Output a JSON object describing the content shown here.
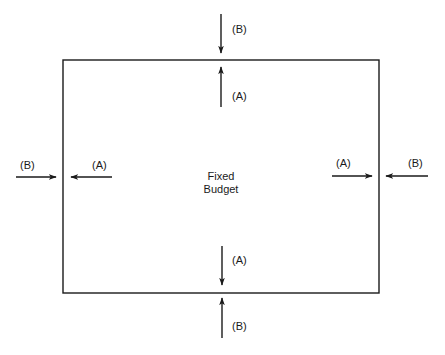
{
  "diagram": {
    "center_label": [
      "Fixed",
      "Budget"
    ],
    "box": {
      "x": 63,
      "y": 60,
      "width": 316,
      "height": 233
    },
    "arrows": [
      {
        "id": "top-outer",
        "label": "(B)",
        "direction": "down",
        "x1": 221,
        "y1": 14,
        "x2": 221,
        "y2": 53,
        "lx": 232,
        "ly": 33
      },
      {
        "id": "top-inner",
        "label": "(A)",
        "direction": "up",
        "x1": 221,
        "y1": 107,
        "x2": 221,
        "y2": 67,
        "lx": 232,
        "ly": 100
      },
      {
        "id": "left-outer",
        "label": "(B)",
        "direction": "right",
        "x1": 16,
        "y1": 177,
        "x2": 56,
        "y2": 177,
        "lx": 20,
        "ly": 169
      },
      {
        "id": "left-inner",
        "label": "(A)",
        "direction": "left",
        "x1": 112,
        "y1": 177,
        "x2": 71,
        "y2": 177,
        "lx": 92,
        "ly": 169
      },
      {
        "id": "right-inner",
        "label": "(A)",
        "direction": "right",
        "x1": 332,
        "y1": 176,
        "x2": 372,
        "y2": 176,
        "lx": 336,
        "ly": 167
      },
      {
        "id": "right-outer",
        "label": "(B)",
        "direction": "left",
        "x1": 428,
        "y1": 176,
        "x2": 386,
        "y2": 176,
        "lx": 408,
        "ly": 167
      },
      {
        "id": "bottom-inner",
        "label": "(A)",
        "direction": "down",
        "x1": 222,
        "y1": 246,
        "x2": 222,
        "y2": 285,
        "lx": 232,
        "ly": 264
      },
      {
        "id": "bottom-outer",
        "label": "(B)",
        "direction": "up",
        "x1": 222,
        "y1": 338,
        "x2": 222,
        "y2": 298,
        "lx": 232,
        "ly": 330
      }
    ],
    "colors": {
      "stroke": "#1a1a1a",
      "background": "#ffffff"
    }
  }
}
